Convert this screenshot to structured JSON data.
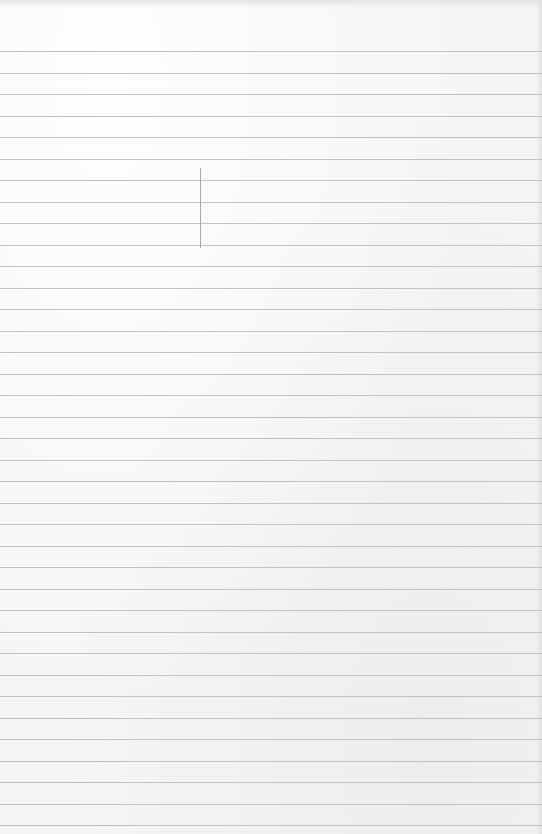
{
  "paper": {
    "type": "lined-notepaper",
    "background_color": "#f5f5f3",
    "rule_color": "#b9b9b7",
    "first_rule_y": 51,
    "rule_spacing": 21.5,
    "rule_count": 37
  },
  "marks": [
    {
      "kind": "vertical-pencil-stroke",
      "x": 200,
      "y_start": 168,
      "y_end": 248
    }
  ]
}
